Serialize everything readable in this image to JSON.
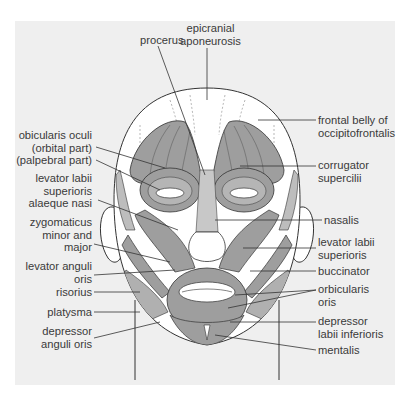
{
  "diagram": {
    "title": "",
    "colors": {
      "page_background": "#ffffff",
      "panel_background": "#efefef",
      "muscle_fill": "#9e9e9e",
      "muscle_light": "#bdbdbd",
      "skin_fill": "#ffffff",
      "outline": "#333333",
      "label_text": "#3a3a3a",
      "leader_line": "#333333"
    },
    "labels_top": [
      {
        "id": "procerus",
        "text": "procerus"
      },
      {
        "id": "epicranial-aponeurosis",
        "text": "epicranial\naponeurosis"
      }
    ],
    "labels_left": [
      {
        "id": "orbicularis-oculi",
        "text": "obicularis oculi\n(orbital part)\n(palpebral part)"
      },
      {
        "id": "levator-labii-superioris-alaeque-nasi",
        "text": "levator labii\nsuperioris\nalaeque nasi"
      },
      {
        "id": "zygomaticus",
        "text": "zygomaticus\nminor and\nmajor"
      },
      {
        "id": "levator-anguli-oris",
        "text": "levator anguli\noris"
      },
      {
        "id": "risorius",
        "text": "risorius"
      },
      {
        "id": "platysma",
        "text": "platysma"
      },
      {
        "id": "depressor-anguli-oris",
        "text": "depressor\nanguli oris"
      }
    ],
    "labels_right": [
      {
        "id": "frontal-belly-occipitofrontalis",
        "text": "frontal belly of\noccipitofrontalis"
      },
      {
        "id": "corrugator-supercilii",
        "text": "corrugator\nsupercilii"
      },
      {
        "id": "nasalis",
        "text": "nasalis"
      },
      {
        "id": "levator-labii-superioris",
        "text": "levator labii\nsuperioris"
      },
      {
        "id": "buccinator",
        "text": "buccinator"
      },
      {
        "id": "orbicularis-oris",
        "text": "orbicularis\noris"
      },
      {
        "id": "depressor-labii-inferioris",
        "text": "depressor\nlabii inferioris"
      },
      {
        "id": "mentalis",
        "text": "mentalis"
      }
    ]
  }
}
